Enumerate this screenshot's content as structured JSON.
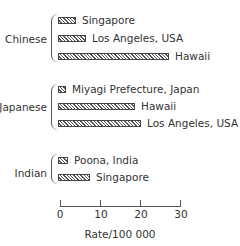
{
  "chart_data": {
    "type": "bar",
    "orientation": "horizontal",
    "title": "",
    "xlabel": "Rate/100 000",
    "ylabel": "",
    "xlim": [
      0,
      30
    ],
    "xticks": [
      "0",
      "10",
      "20",
      "30"
    ],
    "grid": false,
    "legend": "none",
    "groups": [
      {
        "name": "Chinese",
        "bars": [
          {
            "label": "Singapore",
            "value": 4.5
          },
          {
            "label": "Los Angeles, USA",
            "value": 7
          },
          {
            "label": "Hawaii",
            "value": 27.5
          }
        ]
      },
      {
        "name": "Japanese",
        "bars": [
          {
            "label": "Miyagi Prefecture, Japan",
            "value": 2
          },
          {
            "label": "Hawaii",
            "value": 19
          },
          {
            "label": "Los Angeles, USA",
            "value": 20.5
          }
        ]
      },
      {
        "name": "Indian",
        "bars": [
          {
            "label": "Poona, India",
            "value": 2.5
          },
          {
            "label": "Singapore",
            "value": 8
          }
        ]
      }
    ]
  },
  "axis": {
    "ticks": [
      "0",
      "10",
      "20",
      "30"
    ],
    "label": "Rate/100 000"
  }
}
